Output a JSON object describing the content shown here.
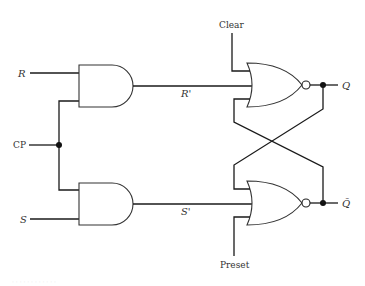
{
  "diagram": {
    "inputs": {
      "r": "R",
      "cp": "CP",
      "s": "S",
      "clear": "Clear",
      "preset": "Preset"
    },
    "intermediate": {
      "r_prime": "R'",
      "s_prime": "S'"
    },
    "outputs": {
      "q": "Q",
      "q_bar": "Q̄"
    },
    "gates": [
      {
        "id": "and-1",
        "type": "AND",
        "inputs": [
          "R",
          "CP"
        ],
        "output": "R'"
      },
      {
        "id": "and-2",
        "type": "AND",
        "inputs": [
          "CP",
          "S"
        ],
        "output": "S'"
      },
      {
        "id": "nor-1",
        "type": "NOR",
        "inputs": [
          "Clear",
          "R'",
          "Q̄"
        ],
        "output": "Q"
      },
      {
        "id": "nor-2",
        "type": "NOR",
        "inputs": [
          "Q",
          "S'",
          "Preset"
        ],
        "output": "Q̄"
      }
    ],
    "caption": "· · · · · · · · · · · ·"
  }
}
